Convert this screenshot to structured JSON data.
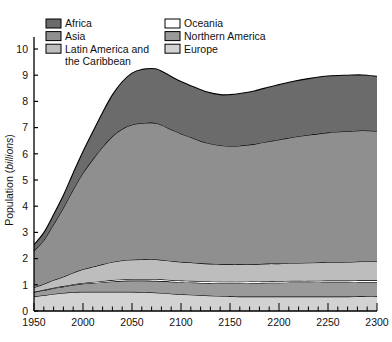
{
  "chart_data": {
    "type": "area",
    "title": "",
    "xlabel": "",
    "ylabel": "Population (billions)",
    "ylabel_plain": "Population (",
    "ylabel_italic": "billions",
    "ylabel_tail": ")",
    "xlim": [
      1950,
      2300
    ],
    "ylim": [
      0,
      10
    ],
    "grid": false,
    "stacked": true,
    "legend_position": "top-left-inside",
    "x_major_ticks": [
      1950,
      2000,
      2050,
      2100,
      2150,
      2200,
      2250,
      2300
    ],
    "x_major_tick_labels": [
      "1950",
      "2000",
      "2050",
      "2100",
      "2150",
      "2200",
      "2250",
      "2300"
    ],
    "x_minor_tick_step": 10,
    "y_ticks": [
      0,
      1,
      2,
      3,
      4,
      5,
      6,
      7,
      8,
      9,
      10
    ],
    "y_tick_labels": [
      "0",
      "1",
      "2",
      "3",
      "4",
      "5",
      "6",
      "7",
      "8",
      "9",
      "10"
    ],
    "x": [
      1950,
      1960,
      1970,
      1980,
      1990,
      2000,
      2010,
      2020,
      2030,
      2040,
      2050,
      2060,
      2075,
      2090,
      2100,
      2110,
      2125,
      2140,
      2150,
      2160,
      2175,
      2190,
      2200,
      2215,
      2230,
      2250,
      2270,
      2285,
      2300
    ],
    "series": [
      {
        "name": "Europe",
        "color": "#d2d2d2",
        "order": 1,
        "values": [
          0.55,
          0.6,
          0.65,
          0.69,
          0.72,
          0.73,
          0.73,
          0.73,
          0.73,
          0.73,
          0.73,
          0.72,
          0.7,
          0.66,
          0.64,
          0.62,
          0.59,
          0.57,
          0.56,
          0.55,
          0.55,
          0.55,
          0.55,
          0.55,
          0.55,
          0.55,
          0.55,
          0.56,
          0.56
        ]
      },
      {
        "name": "Northern America",
        "color": "#9a9a9a",
        "order": 2,
        "values": [
          0.17,
          0.19,
          0.22,
          0.24,
          0.27,
          0.31,
          0.34,
          0.37,
          0.4,
          0.42,
          0.43,
          0.44,
          0.45,
          0.46,
          0.46,
          0.47,
          0.48,
          0.49,
          0.5,
          0.51,
          0.52,
          0.53,
          0.53,
          0.54,
          0.54,
          0.55,
          0.55,
          0.55,
          0.55
        ]
      },
      {
        "name": "Oceania",
        "color": "#ffffff",
        "order": 3,
        "values": [
          0.01,
          0.02,
          0.02,
          0.02,
          0.03,
          0.03,
          0.04,
          0.04,
          0.05,
          0.05,
          0.05,
          0.05,
          0.06,
          0.06,
          0.06,
          0.06,
          0.06,
          0.06,
          0.06,
          0.06,
          0.06,
          0.06,
          0.06,
          0.06,
          0.06,
          0.06,
          0.06,
          0.06,
          0.06
        ]
      },
      {
        "name": "Latin America and the Caribbean",
        "color": "#bdbdbd",
        "order": 4,
        "values": [
          0.17,
          0.22,
          0.29,
          0.36,
          0.44,
          0.52,
          0.58,
          0.64,
          0.69,
          0.73,
          0.75,
          0.76,
          0.76,
          0.73,
          0.71,
          0.7,
          0.68,
          0.67,
          0.66,
          0.66,
          0.66,
          0.67,
          0.67,
          0.68,
          0.69,
          0.7,
          0.71,
          0.72,
          0.72
        ]
      },
      {
        "name": "Asia",
        "color": "#8f8f8f",
        "order": 5,
        "values": [
          1.4,
          1.67,
          2.13,
          2.63,
          3.18,
          3.68,
          4.1,
          4.48,
          4.8,
          5.02,
          5.15,
          5.2,
          5.2,
          5.02,
          4.9,
          4.78,
          4.62,
          4.53,
          4.52,
          4.53,
          4.58,
          4.67,
          4.73,
          4.81,
          4.88,
          4.95,
          4.99,
          5.0,
          4.98
        ]
      },
      {
        "name": "Africa",
        "color": "#6b6b6b",
        "order": 6,
        "values": [
          0.23,
          0.29,
          0.37,
          0.48,
          0.63,
          0.82,
          1.05,
          1.32,
          1.58,
          1.8,
          1.97,
          2.05,
          2.07,
          2.02,
          1.99,
          1.97,
          1.95,
          1.94,
          1.96,
          1.99,
          2.03,
          2.07,
          2.1,
          2.13,
          2.15,
          2.16,
          2.14,
          2.12,
          2.09
        ]
      }
    ],
    "totals_key_points": {
      "1950": 2.53,
      "2000": 6.09,
      "2050": 9.08,
      "2075": 9.21,
      "2100": 8.76,
      "2150": 8.46,
      "2175": 8.4,
      "2200": 8.44,
      "2250": 8.6,
      "2300": 8.96
    }
  },
  "legend": {
    "column_left": [
      {
        "label": "Africa",
        "color": "#6b6b6b"
      },
      {
        "label": "Asia",
        "color": "#8f8f8f"
      },
      {
        "label": "Latin America and",
        "label2": "the Caribbean",
        "color": "#bdbdbd"
      }
    ],
    "column_right": [
      {
        "label": "Oceania",
        "color": "#ffffff"
      },
      {
        "label": "Northern America",
        "color": "#9a9a9a"
      },
      {
        "label": "Europe",
        "color": "#d2d2d2"
      }
    ]
  }
}
